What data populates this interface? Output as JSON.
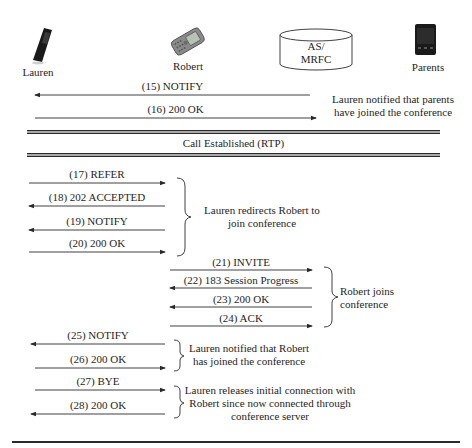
{
  "actors": [
    {
      "id": "lauren",
      "label": "Lauren",
      "icon": "flip-phone-icon"
    },
    {
      "id": "robert",
      "label": "Robert",
      "icon": "slider-phone-icon"
    },
    {
      "id": "server",
      "label_line1": "AS/",
      "label_line2": "MRFC",
      "icon": "database-cylinder-icon"
    },
    {
      "id": "parents",
      "label": "Parents",
      "icon": "smartphone-icon"
    }
  ],
  "messages": [
    {
      "num": "(15)",
      "label": "(15) NOTIFY",
      "direction": "left"
    },
    {
      "num": "(16)",
      "label": "(16) 200 OK",
      "direction": "right"
    },
    {
      "num": "(17)",
      "label": "(17) REFER",
      "direction": "right"
    },
    {
      "num": "(18)",
      "label": "(18) 202 ACCEPTED",
      "direction": "left"
    },
    {
      "num": "(19)",
      "label": "(19) NOTIFY",
      "direction": "left"
    },
    {
      "num": "(20)",
      "label": "(20) 200 OK",
      "direction": "right"
    },
    {
      "num": "(21)",
      "label": "(21) INVITE",
      "direction": "right"
    },
    {
      "num": "(22)",
      "label": "(22) 183 Session Progress",
      "direction": "left"
    },
    {
      "num": "(23)",
      "label": "(23) 200 OK",
      "direction": "left"
    },
    {
      "num": "(24)",
      "label": "(24) ACK",
      "direction": "right"
    },
    {
      "num": "(25)",
      "label": "(25) NOTIFY",
      "direction": "left"
    },
    {
      "num": "(26)",
      "label": "(26) 200 OK",
      "direction": "right"
    },
    {
      "num": "(27)",
      "label": "(27) BYE",
      "direction": "right"
    },
    {
      "num": "(28)",
      "label": "(28) 200 OK",
      "direction": "left"
    }
  ],
  "notes": {
    "parents_joined": {
      "line1": "Lauren notified that parents",
      "line2": "have joined the conference"
    },
    "redirect": {
      "line1": "Lauren redirects Robert to",
      "line2": "join conference"
    },
    "robert_joins": {
      "line1": "Robert joins",
      "line2": "conference"
    },
    "robert_joined": {
      "line1": "Lauren notified that Robert",
      "line2": "has joined the conference"
    },
    "release": {
      "line1": "Lauren releases initial connection with",
      "line2": "Robert since now connected through",
      "line3": "conference server"
    }
  },
  "banner": {
    "label": "Call Established (RTP)"
  },
  "colors": {
    "line": "#2a2a2a",
    "text": "#1e1e1e",
    "phone": "#1a1a1a",
    "robert_phone": "#8a8a8a"
  }
}
